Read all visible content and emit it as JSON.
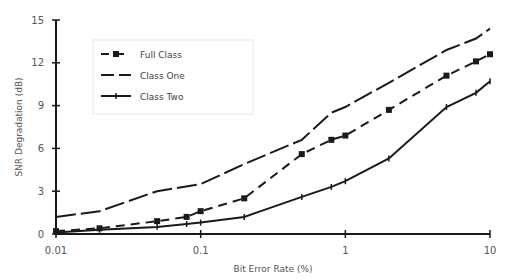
{
  "chart_data": {
    "type": "line",
    "title": "",
    "xlabel": "Bit Error Rate (%)",
    "ylabel": "SNR Degradation (dB)",
    "xscale": "log",
    "xlim": [
      0.01,
      10
    ],
    "ylim": [
      0,
      15
    ],
    "xticks": [
      0.01,
      0.1,
      1,
      10
    ],
    "xtick_labels": [
      "0.01",
      "0.1",
      "1",
      "10"
    ],
    "yticks": [
      0,
      3,
      6,
      9,
      12,
      15
    ],
    "ytick_labels": [
      "0",
      "3",
      "6",
      "9",
      "12",
      "15"
    ],
    "grid": false,
    "legend_position": "top-left",
    "series": [
      {
        "name": "Full Class",
        "style": "dashed-square-markers",
        "x": [
          0.01,
          0.02,
          0.05,
          0.08,
          0.1,
          0.2,
          0.5,
          0.8,
          1,
          2,
          5,
          8,
          10
        ],
        "y": [
          0.2,
          0.4,
          0.9,
          1.2,
          1.6,
          2.5,
          5.6,
          6.6,
          6.9,
          8.7,
          11.1,
          12.1,
          12.6
        ]
      },
      {
        "name": "Class One",
        "style": "long-dashed",
        "x": [
          0.01,
          0.02,
          0.05,
          0.1,
          0.2,
          0.5,
          0.8,
          1,
          2,
          5,
          8,
          10
        ],
        "y": [
          1.2,
          1.6,
          3.0,
          3.5,
          4.9,
          6.6,
          8.5,
          8.9,
          10.6,
          12.9,
          13.7,
          14.4
        ]
      },
      {
        "name": "Class Two",
        "style": "solid-tick-markers",
        "x": [
          0.01,
          0.02,
          0.05,
          0.08,
          0.1,
          0.2,
          0.5,
          0.8,
          1,
          2,
          5,
          8,
          10
        ],
        "y": [
          0.1,
          0.3,
          0.5,
          0.7,
          0.8,
          1.2,
          2.6,
          3.3,
          3.7,
          5.3,
          8.9,
          9.9,
          10.7
        ]
      }
    ]
  },
  "colors": {
    "line": "#1a1a1a",
    "text": "#555555",
    "axis": "#222222"
  }
}
